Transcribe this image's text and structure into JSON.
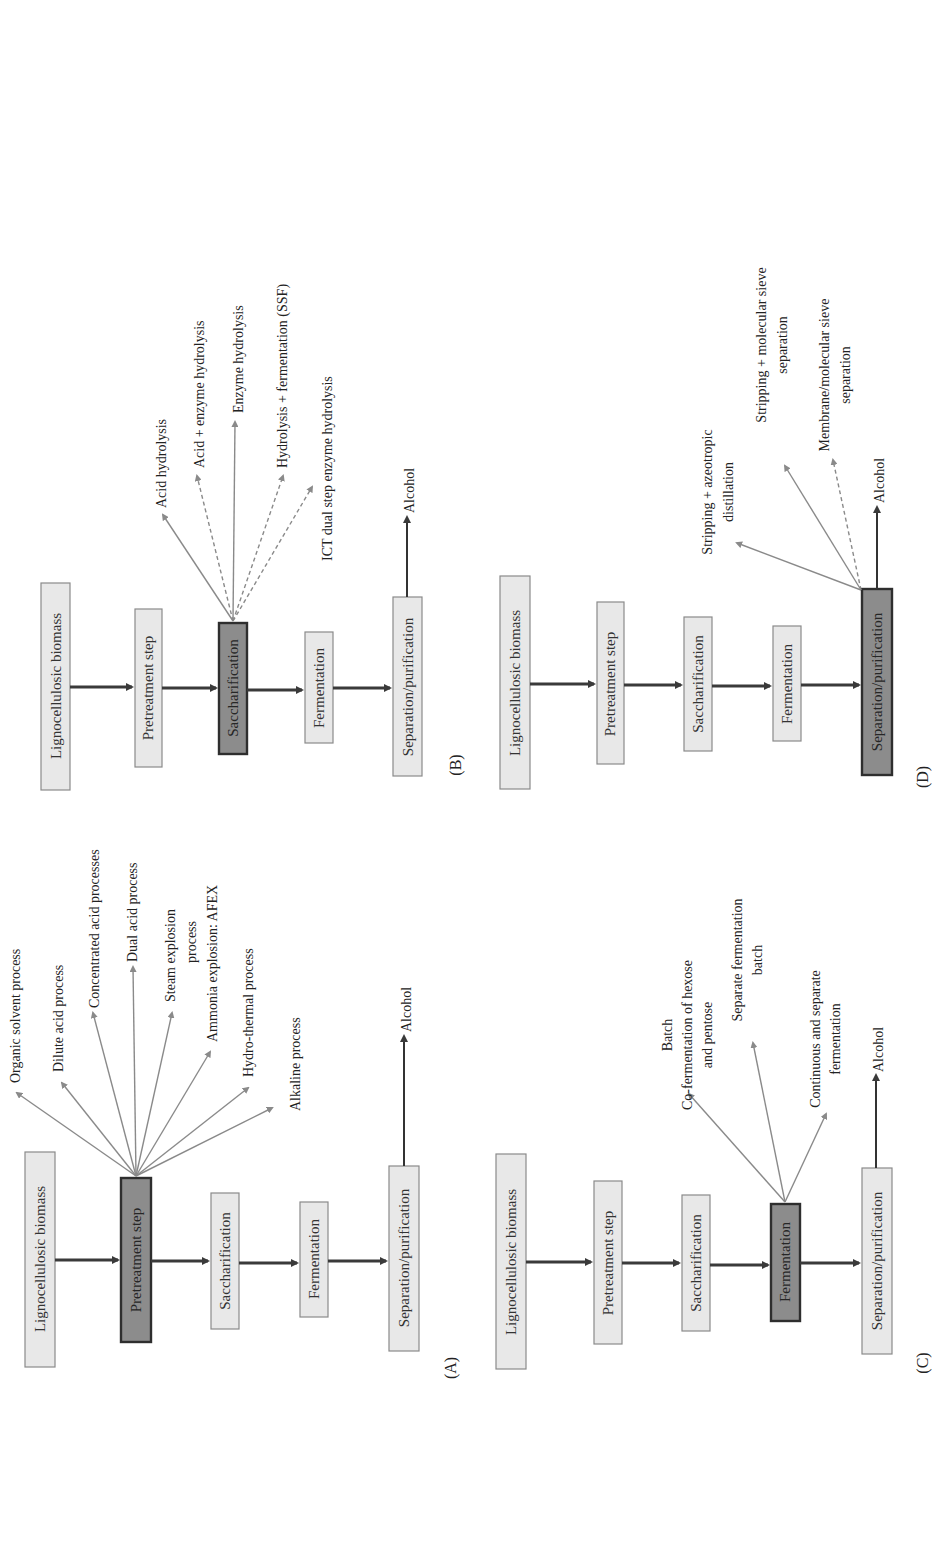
{
  "figure": {
    "orientation": "rotated 90° counter-clockwise",
    "colors": {
      "box_fill": "#e8e8e8",
      "box_highlight_fill": "#8c8c8c",
      "flow_arrow": "#3a3a3a",
      "branch_arrow": "#8a8a8a"
    },
    "steps": [
      "Lignocellulosic biomass",
      "Pretreatment step",
      "Saccharification",
      "Fermentation",
      "Separation/purification"
    ],
    "output": "Alcohol",
    "panels": {
      "A": {
        "label": "(A)",
        "highlighted_step": "Pretreatment step",
        "options": [
          "Organic solvent process",
          "Dilute acid process",
          "Concentrated acid processes",
          "Dual acid process",
          "Steam explosion",
          "process",
          "Ammonia explosion: AFEX",
          "Hydro-thermal process",
          "Alkaline process"
        ]
      },
      "B": {
        "label": "(B)",
        "highlighted_step": "Saccharification",
        "options": [
          "Acid hydrolysis",
          "Acid + enzyme hydrolysis",
          "Enzyme hydrolysis",
          "Hydrolysis + fermentation (SSF)",
          "ICT dual step enzyme hydrolysis"
        ]
      },
      "C": {
        "label": "(C)",
        "highlighted_step": "Fermentation",
        "options": [
          "Batch",
          "Co-fermentation of hexose",
          "and pentose",
          "Separate fermentation",
          "batch",
          "Continuous and separate",
          "fermentation"
        ]
      },
      "D": {
        "label": "(D)",
        "highlighted_step": "Separation/purification",
        "options": [
          "Stripping + azeotropic",
          "distillation",
          "Stripping + molecular sieve",
          "separation",
          "Membrane/molecular sieve",
          "separation"
        ]
      }
    }
  }
}
